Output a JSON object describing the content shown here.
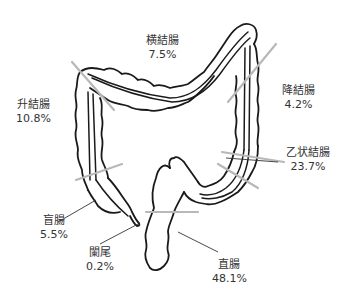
{
  "diagram": {
    "title": "",
    "segments": [
      {
        "id": "transverse",
        "name": "横結腸",
        "percent": "7.5%"
      },
      {
        "id": "ascending",
        "name": "升結腸",
        "percent": "10.8%"
      },
      {
        "id": "descending",
        "name": "降結腸",
        "percent": "4.2%"
      },
      {
        "id": "sigmoid",
        "name": "乙状結腸",
        "percent": "23.7%"
      },
      {
        "id": "cecum",
        "name": "盲腸",
        "percent": "5.5%"
      },
      {
        "id": "appendix",
        "name": "闌尾",
        "percent": "0.2%"
      },
      {
        "id": "rectum",
        "name": "直腸",
        "percent": "48.1%"
      }
    ],
    "colors": {
      "outline": "#1a1a1a",
      "divider": "#b8b8b8",
      "label": "#333333"
    }
  }
}
